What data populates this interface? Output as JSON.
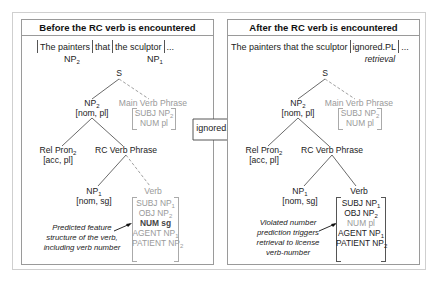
{
  "arrow": {
    "label": "ignored.PL"
  },
  "panels": {
    "before": {
      "title": "Before the RC verb is encountered",
      "sentence": {
        "w1": "The painters",
        "w2": "that",
        "w3": "the sculptor",
        "w4": "...",
        "l1": "NP",
        "l1_sub": "2",
        "l3": "NP",
        "l3_sub": "1"
      },
      "tree": {
        "s": "S",
        "np2": "NP",
        "np2_sub": "2",
        "np2_feat": "[nom, pl]",
        "mvp": "Main Verb Phrase",
        "mvp_feat": [
          {
            "text": "SUBJ NP",
            "sub": "2"
          },
          {
            "text": "NUM pl",
            "sub": ""
          }
        ],
        "relpron": "Rel Pron",
        "relpron_sub": "2",
        "relpron_feat": "[acc, pl]",
        "rcvp": "RC Verb Phrase",
        "np1": "NP",
        "np1_sub": "1",
        "np1_feat": "[nom, sg]",
        "verb": "Verb",
        "verb_feat": [
          {
            "text": "SUBJ NP",
            "sub": "1"
          },
          {
            "text": "OBJ NP",
            "sub": "2"
          },
          {
            "text": "NUM sg",
            "sub": ""
          },
          {
            "text": "AGENT NP",
            "sub": "1"
          },
          {
            "text": "PATIENT NP",
            "sub": "2"
          }
        ]
      },
      "note": [
        "Predicted feature",
        "structure of the verb,",
        "including verb number"
      ]
    },
    "after": {
      "title": "After the RC verb is encountered",
      "sentence": {
        "w1": "The painters that the sculptor",
        "w2": "ignored.PL",
        "w3": "...",
        "l2": "retrieval"
      },
      "tree": {
        "s": "S",
        "np2": "NP",
        "np2_sub": "2",
        "np2_feat": "[nom, pl]",
        "mvp": "Main Verb Phrase",
        "mvp_feat": [
          {
            "text": "SUBJ NP",
            "sub": "2"
          },
          {
            "text": "NUM pl",
            "sub": ""
          }
        ],
        "relpron": "Rel Pron",
        "relpron_sub": "2",
        "relpron_feat": "[acc, pl]",
        "rcvp": "RC Verb Phrase",
        "np1": "NP",
        "np1_sub": "1",
        "np1_feat": "[nom, sg]",
        "verb": "Verb",
        "verb_feat": [
          {
            "text": "SUBJ NP",
            "sub": "1"
          },
          {
            "text": "OBJ NP",
            "sub": "2"
          },
          {
            "text": "NUM pl",
            "sub": ""
          },
          {
            "text": "AGENT NP",
            "sub": "1"
          },
          {
            "text": "PATIENT NP",
            "sub": "2"
          }
        ]
      },
      "note": [
        "Violated number",
        "prediction triggers",
        "retrieval to license",
        "verb-number"
      ]
    }
  },
  "colors": {
    "text": "#222222",
    "grey": "#9a9a9a",
    "border": "#9a9a9a",
    "frame": "#cfcfcf"
  }
}
